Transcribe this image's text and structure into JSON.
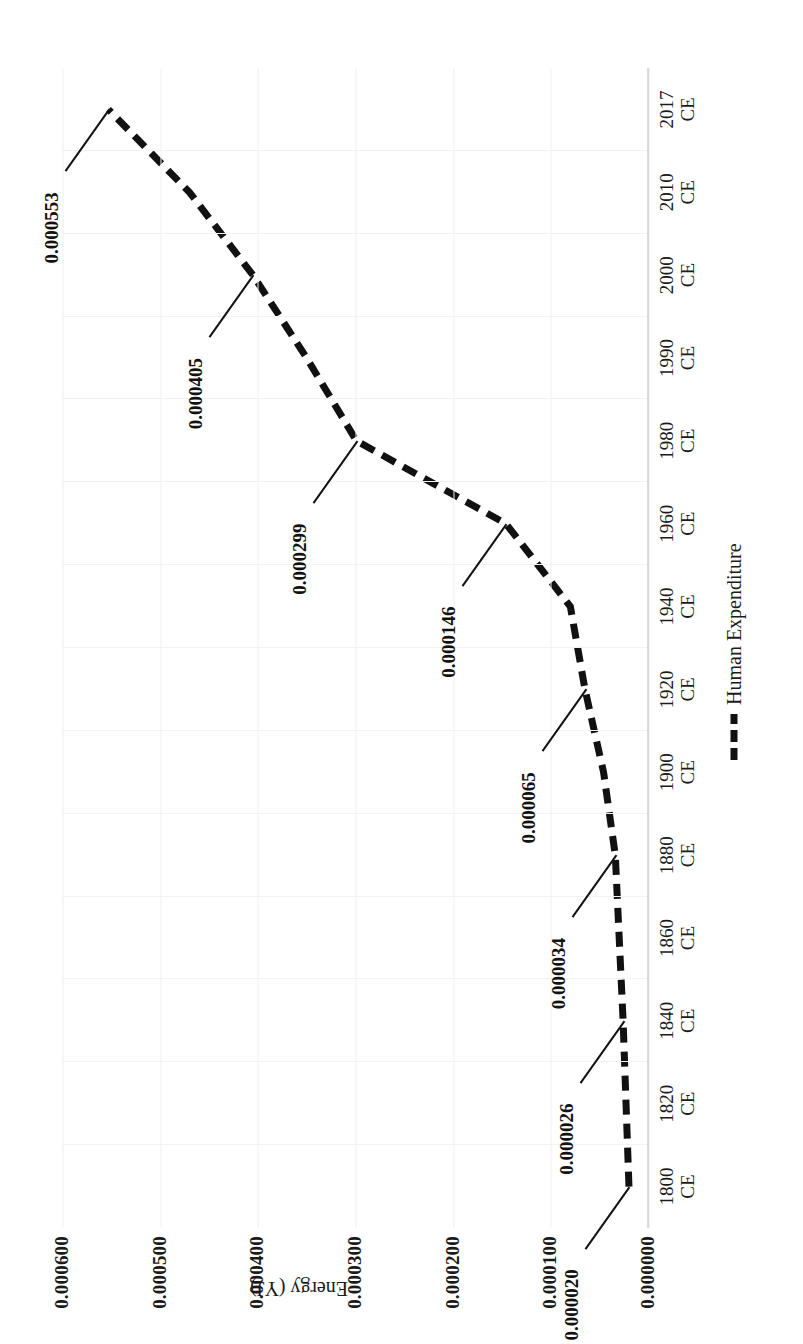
{
  "figure": {
    "orientation": "rotated-90",
    "background": "#ffffff",
    "line_color": "#111111"
  },
  "axis": {
    "y_title": "Energy (YJ)",
    "y_ticks": [
      "0.000600",
      "0.000500",
      "0.000400",
      "0.000300",
      "0.000200",
      "0.000100",
      "0.000000"
    ],
    "x_unit_suffix": "CE"
  },
  "legend": {
    "series_label": "Human Expenditure",
    "marker": "dashed-line-swatch"
  },
  "chart_data": {
    "type": "line",
    "title": "",
    "xlabel": "",
    "ylabel": "Energy (YJ)",
    "ylim": [
      0.0,
      0.0006
    ],
    "grid": true,
    "legend_position": "bottom-right",
    "categories": [
      "1800 CE",
      "1820 CE",
      "1840 CE",
      "1860 CE",
      "1880 CE",
      "1900 CE",
      "1920 CE",
      "1940 CE",
      "1960 CE",
      "1980 CE",
      "1990 CE",
      "2000 CE",
      "2010 CE",
      "2017 CE"
    ],
    "series": [
      {
        "name": "Human Expenditure",
        "values": [
          2e-05,
          2.3e-05,
          2.6e-05,
          3e-05,
          3.4e-05,
          4.6e-05,
          6.5e-05,
          8e-05,
          0.000146,
          0.000299,
          0.00035,
          0.000405,
          0.00047,
          0.000553
        ]
      }
    ],
    "point_labels": [
      {
        "category": "1800 CE",
        "text": "0.000020"
      },
      {
        "category": "1840 CE",
        "text": "0.000026"
      },
      {
        "category": "1880 CE",
        "text": "0.000034"
      },
      {
        "category": "1920 CE",
        "text": "0.000065"
      },
      {
        "category": "1960 CE",
        "text": "0.000146"
      },
      {
        "category": "1980 CE",
        "text": "0.000299"
      },
      {
        "category": "2000 CE",
        "text": "0.000405"
      },
      {
        "category": "2017 CE",
        "text": "0.000553"
      }
    ],
    "y_tick_values": [
      0.0006,
      0.0005,
      0.0004,
      0.0003,
      0.0002,
      0.0001,
      0.0
    ]
  }
}
